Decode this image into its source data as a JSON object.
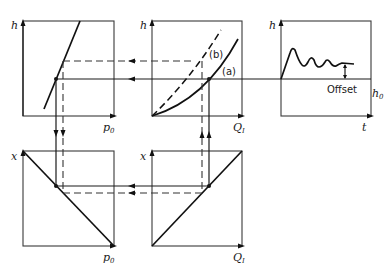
{
  "diagram": {
    "type": "graphical construction of control-loop offset",
    "panels": {
      "top_left": {
        "y_axis": "h",
        "x_axis": "p",
        "x_axis_sub": "0",
        "curve": "linear rising"
      },
      "top_middle": {
        "y_axis": "h",
        "x_axis": "Q",
        "x_axis_sub": "I",
        "curves": [
          {
            "label": "(a)",
            "style": "solid"
          },
          {
            "label": "(b)",
            "style": "dashed"
          }
        ]
      },
      "top_right": {
        "y_axis": "h",
        "x_axis": "t",
        "reference": "h",
        "reference_sub": "0",
        "annotation": "Offset",
        "curve": "damped oscillation"
      },
      "bottom_left": {
        "y_axis": "x",
        "x_axis": "p",
        "x_axis_sub": "0",
        "curve": "linear falling"
      },
      "bottom_middle": {
        "y_axis": "x",
        "x_axis": "Q",
        "x_axis_sub": "I",
        "curve": "linear rising"
      }
    },
    "connectors": {
      "top_row": "arrows pointing left (solid and dashed)",
      "left_column": "arrows pointing down (solid and dashed)",
      "bottom_row": "arrows pointing left (solid and dashed)",
      "middle_column": "arrows pointing up (solid and dashed)"
    }
  }
}
